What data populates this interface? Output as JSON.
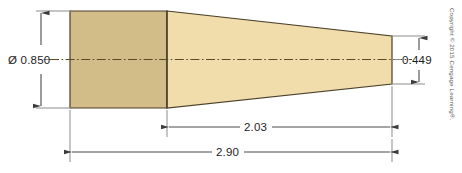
{
  "drawing": {
    "title": "Tapered shaft dimensioned drawing",
    "background_color": "#ffffff",
    "part": {
      "name": "tapered-shaft",
      "cylinder_fill": "#d2bc88",
      "taper_fill": "#f1dcac",
      "outline_color": "#4a3f27"
    },
    "centerline": {
      "name": "centerline",
      "color": "#5a4a25",
      "style": "dash-dot"
    },
    "dimensions": [
      {
        "id": "major-diameter",
        "label": "Ø 0.850",
        "value": "0.850",
        "symbol": "Ø",
        "orientation": "vertical",
        "position": "left"
      },
      {
        "id": "minor-diameter",
        "label": "0.449",
        "value": "0.449",
        "symbol": "",
        "orientation": "vertical",
        "position": "right"
      },
      {
        "id": "taper-length",
        "label": "2.03",
        "value": "2.03",
        "symbol": "",
        "orientation": "horizontal",
        "position": "lower"
      },
      {
        "id": "overall-length",
        "label": "2.90",
        "value": "2.90",
        "symbol": "",
        "orientation": "horizontal",
        "position": "bottom"
      }
    ],
    "copyright": {
      "text": "Copyright © 2015 Cengage Learning®.",
      "orientation": "vertical",
      "color": "#555555"
    }
  }
}
